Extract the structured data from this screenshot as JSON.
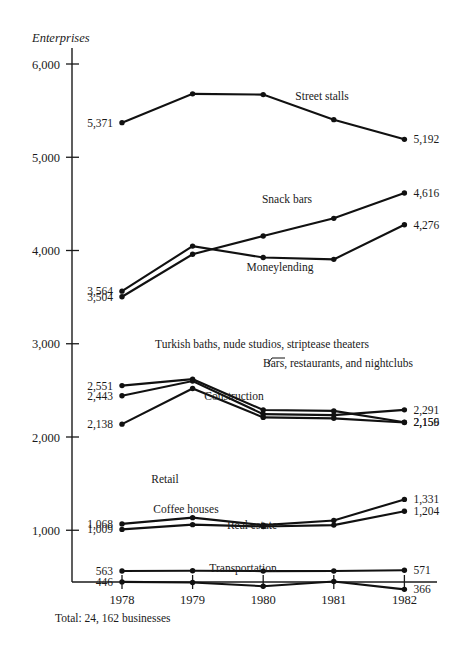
{
  "chart_data": {
    "type": "line",
    "title": "",
    "ylabel": "Enterprises",
    "xlabel": "",
    "categories": [
      "1978",
      "1979",
      "1980",
      "1981",
      "1982"
    ],
    "ylim": [
      0,
      6000
    ],
    "yticks": [
      1000,
      2000,
      3000,
      4000,
      5000,
      6000
    ],
    "ytick_labels": [
      "1,000",
      "2,000",
      "3,000",
      "4,000",
      "5,000",
      "6,000"
    ],
    "grid": false,
    "legend": "inline-labels",
    "footnote": "Total: 24, 162 businesses",
    "series": [
      {
        "name": "Street stalls",
        "values": [
          5371,
          5680,
          5672,
          5403,
          5192
        ],
        "start_label": "5,371",
        "end_label": "5,192"
      },
      {
        "name": "Snack bars",
        "values": [
          3504,
          3960,
          4155,
          4345,
          4616
        ],
        "start_label": "3,504",
        "end_label": "4,616"
      },
      {
        "name": "Moneylending",
        "values": [
          3564,
          4047,
          3925,
          3905,
          4276
        ],
        "start_label": "3,564",
        "end_label": "4,276"
      },
      {
        "name": "Turkish baths, nude studios, striptease theaters",
        "values": [
          2551,
          2620,
          2290,
          2280,
          2159
        ],
        "start_label": "2,551",
        "end_label": "2,159"
      },
      {
        "name": "Bars, restaurants, and nightclubs",
        "values": [
          2443,
          2600,
          2245,
          2235,
          2291
        ],
        "start_label": "2,443",
        "end_label": "2,291"
      },
      {
        "name": "Construction",
        "values": [
          2138,
          2520,
          2210,
          2200,
          2156
        ],
        "start_label": "2,138",
        "end_label": "2,156"
      },
      {
        "name": "Retail",
        "values": [
          1068,
          1135,
          1055,
          1105,
          1331
        ],
        "start_label": "1,068",
        "end_label": "1,331"
      },
      {
        "name": "Coffee houses",
        "values": [
          1009,
          1060,
          1040,
          1055,
          1204
        ],
        "start_label": "1,009",
        "end_label": "1,204"
      },
      {
        "name": "Real estate",
        "values": [
          563,
          566,
          562,
          563,
          571
        ],
        "start_label": "563",
        "end_label": "571"
      },
      {
        "name": "Transportation",
        "values": [
          446,
          440,
          400,
          450,
          366
        ],
        "start_label": "446",
        "end_label": "366"
      }
    ],
    "annotations": [
      {
        "name": "Street stalls",
        "text": "Street stalls",
        "x": 322,
        "y": 100,
        "anchor": "middle"
      },
      {
        "name": "Snack bars",
        "text": "Snack bars",
        "x": 287,
        "y": 203,
        "anchor": "middle"
      },
      {
        "name": "Moneylending",
        "text": "Moneylending",
        "x": 280,
        "y": 271,
        "anchor": "middle"
      },
      {
        "name": "Turkish baths",
        "text": "Turkish baths, nude studios, striptease theaters",
        "x": 262,
        "y": 348,
        "anchor": "middle"
      },
      {
        "name": "Bars restaurants",
        "text": "Bars, restaurants, and nightclubs",
        "x": 338,
        "y": 367,
        "anchor": "middle"
      },
      {
        "name": "Construction",
        "text": "Construction",
        "x": 234,
        "y": 400,
        "anchor": "middle"
      },
      {
        "name": "Retail",
        "text": "Retail",
        "x": 165,
        "y": 483,
        "anchor": "middle"
      },
      {
        "name": "Coffee houses",
        "text": "Coffee houses",
        "x": 186,
        "y": 513,
        "anchor": "middle"
      },
      {
        "name": "Real estate",
        "text": "Real estate",
        "x": 252,
        "y": 529,
        "anchor": "middle"
      },
      {
        "name": "Transportation",
        "text": "Transportation",
        "x": 243,
        "y": 572,
        "anchor": "middle"
      }
    ]
  }
}
